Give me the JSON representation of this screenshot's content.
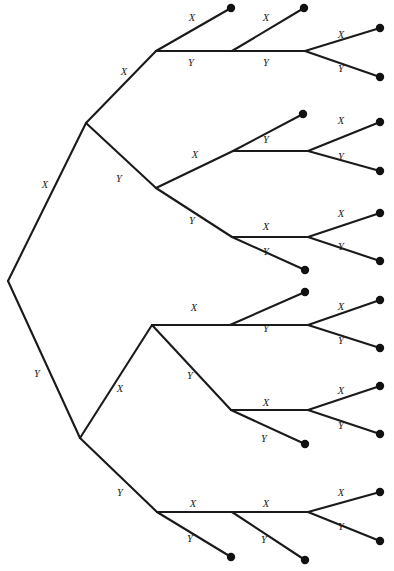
{
  "diagram": {
    "type": "binary-decision-tree",
    "background_color": "#ffffff",
    "line_color": "#1a1a1a",
    "node_color": "#111111",
    "label_x": "X",
    "label_y": "Y",
    "depth": 4,
    "terminal_count": 16,
    "root": {
      "x": 8,
      "y": 281
    },
    "nodes": [
      {
        "id": "root",
        "x": 8,
        "y": 281
      },
      {
        "id": "n-x",
        "x": 86,
        "y": 123
      },
      {
        "id": "n-y",
        "x": 80,
        "y": 438
      },
      {
        "id": "n-xx",
        "x": 156,
        "y": 51
      },
      {
        "id": "n-xy",
        "x": 156,
        "y": 188
      },
      {
        "id": "n-yx",
        "x": 152,
        "y": 325
      },
      {
        "id": "n-yy",
        "x": 157,
        "y": 512
      },
      {
        "id": "n-xxx",
        "x": 232,
        "y": 51
      },
      {
        "id": "n-xxy",
        "x": 233,
        "y": 151
      },
      {
        "id": "n-xyx",
        "x": 232,
        "y": 237
      },
      {
        "id": "n-xyy",
        "x": 230,
        "y": 325
      },
      {
        "id": "n-yxx",
        "x": 231,
        "y": 410
      },
      {
        "id": "n-yxy",
        "x": 232,
        "y": 512
      },
      {
        "id": "n-yyx",
        "x": 305,
        "y": 51
      }
    ],
    "edges": [
      {
        "from": "root",
        "to": "n-x",
        "label": "X",
        "lx": 43,
        "ly": 188
      },
      {
        "from": "root",
        "to": "n-y",
        "label": "Y",
        "lx": 37,
        "ly": 373
      },
      {
        "from": "n-x",
        "to": "n-xx",
        "label": "X",
        "lx": 123,
        "ly": 73
      },
      {
        "from": "n-x",
        "to": "n-xy",
        "label": "Y",
        "lx": 118,
        "ly": 178
      },
      {
        "from": "n-y",
        "to": "n-yx",
        "label": "X",
        "lx": 117,
        "ly": 390
      },
      {
        "from": "n-y",
        "to": "n-yy",
        "label": "Y",
        "lx": 117,
        "ly": 493
      },
      {
        "from": "n-xx",
        "to": "t1",
        "label": "X",
        "lx": 192,
        "ly": 20
      },
      {
        "from": "n-xx",
        "to": "n-xxx",
        "label": "Y",
        "lx": 192,
        "ly": 64
      },
      {
        "from": "n-xy",
        "to": "n-xxy",
        "label": "X",
        "lx": 194,
        "ly": 156
      },
      {
        "from": "n-xy",
        "to": "n-xyx",
        "label": "Y",
        "lx": 192,
        "ly": 222
      },
      {
        "from": "n-yx",
        "to": "n-xyy",
        "label": "X",
        "lx": 192,
        "ly": 309
      },
      {
        "from": "n-yx",
        "to": "n-yxx",
        "label": "Y",
        "lx": 188,
        "ly": 377
      },
      {
        "from": "n-yy",
        "to": "n-yxy",
        "label": "X",
        "lx": 193,
        "ly": 505
      },
      {
        "from": "n-yy",
        "to": "t16",
        "label": "Y",
        "lx": 192,
        "ly": 541
      },
      {
        "from": "n-xxx",
        "to": "t2",
        "label": "X",
        "lx": 265,
        "ly": 20
      },
      {
        "from": "n-xxx",
        "to": "n-yyx",
        "label": "Y",
        "lx": 266,
        "ly": 64
      },
      {
        "from": "n-xxy",
        "to": "t3",
        "label": "X",
        "lx": 268,
        "ly": 124
      },
      {
        "from": "n-xxy",
        "to": "t4",
        "label": "Y",
        "lx": 268,
        "ly": 163
      },
      {
        "from": "n-xyx",
        "to": "t5",
        "label": "X",
        "lx": 266,
        "ly": 302
      },
      {
        "from": "n-xyx",
        "to": "t6",
        "label": "Y",
        "lx": 266,
        "ly": 253
      },
      {
        "from": "n-xyy",
        "to": "t7",
        "label": "X",
        "lx": 266,
        "ly": 340
      },
      {
        "from": "n-yxx",
        "to": "t8",
        "label": "X",
        "lx": 266,
        "ly": 393
      },
      {
        "from": "n-yxx",
        "to": "t9",
        "label": "Y",
        "lx": 266,
        "ly": 432
      },
      {
        "from": "n-yxy",
        "to": "t10",
        "label": "X",
        "lx": 266,
        "ly": 505
      },
      {
        "from": "n-yxy",
        "to": "t11",
        "label": "Y",
        "lx": 266,
        "ly": 541
      },
      {
        "from": "n-yyx",
        "to": "t12",
        "label": "X",
        "lx": 340,
        "ly": 36
      },
      {
        "from": "n-yyx",
        "to": "t13",
        "label": "Y",
        "lx": 340,
        "ly": 66
      },
      {
        "from": "n-yyx2",
        "to": "t14",
        "label": "X",
        "lx": 340,
        "ly": 133
      },
      {
        "from": "n-yyx2",
        "to": "t15",
        "label": "Y",
        "lx": 340,
        "ly": 165
      }
    ],
    "terminals": [
      {
        "id": "t1",
        "x": 231,
        "y": 8
      },
      {
        "id": "t2",
        "x": 304,
        "y": 8
      },
      {
        "id": "t3",
        "x": 380,
        "y": 28
      },
      {
        "id": "t4",
        "x": 380,
        "y": 77
      },
      {
        "id": "t5",
        "x": 303,
        "y": 114
      },
      {
        "id": "t6",
        "x": 380,
        "y": 122
      },
      {
        "id": "t7",
        "x": 380,
        "y": 171
      },
      {
        "id": "t8",
        "x": 305,
        "y": 228
      },
      {
        "id": "t9",
        "x": 380,
        "y": 213
      },
      {
        "id": "t10",
        "x": 380,
        "y": 261
      },
      {
        "id": "t11",
        "x": 305,
        "y": 270
      },
      {
        "id": "t12",
        "x": 305,
        "y": 292
      },
      {
        "id": "t13",
        "x": 380,
        "y": 300
      },
      {
        "id": "t14",
        "x": 380,
        "y": 348
      },
      {
        "id": "t15",
        "x": 305,
        "y": 385
      },
      {
        "id": "t16",
        "x": 380,
        "y": 386
      },
      {
        "id": "t17",
        "x": 380,
        "y": 434
      },
      {
        "id": "t18",
        "x": 303,
        "y": 444
      },
      {
        "id": "t19",
        "x": 231,
        "y": 557
      },
      {
        "id": "t20",
        "x": 305,
        "y": 560
      },
      {
        "id": "t21",
        "x": 380,
        "y": 492
      },
      {
        "id": "t22",
        "x": 380,
        "y": 541
      }
    ]
  },
  "edge_labels": {
    "l1": {
      "text": "X",
      "x": 45,
      "y": 186
    },
    "l2": {
      "text": "Y",
      "x": 37,
      "y": 375
    },
    "l3": {
      "text": "X",
      "x": 124,
      "y": 73
    },
    "l4": {
      "text": "Y",
      "x": 119,
      "y": 180
    },
    "l5": {
      "text": "X",
      "x": 120,
      "y": 390
    },
    "l6": {
      "text": "Y",
      "x": 120,
      "y": 494
    },
    "l7": {
      "text": "X",
      "x": 192,
      "y": 19
    },
    "l8": {
      "text": "Y",
      "x": 191,
      "y": 64
    },
    "l9": {
      "text": "X",
      "x": 266,
      "y": 19
    },
    "l10": {
      "text": "Y",
      "x": 266,
      "y": 64
    },
    "l11": {
      "text": "X",
      "x": 341,
      "y": 36
    },
    "l12": {
      "text": "Y",
      "x": 341,
      "y": 70
    },
    "l13": {
      "text": "X",
      "x": 195,
      "y": 156
    },
    "l14": {
      "text": "Y",
      "x": 266,
      "y": 141
    },
    "l15": {
      "text": "X",
      "x": 341,
      "y": 122
    },
    "l16": {
      "text": "Y",
      "x": 341,
      "y": 158
    },
    "l17": {
      "text": "Y",
      "x": 192,
      "y": 222
    },
    "l18": {
      "text": "X",
      "x": 266,
      "y": 228
    },
    "l19": {
      "text": "Y",
      "x": 266,
      "y": 253
    },
    "l20": {
      "text": "X",
      "x": 341,
      "y": 215
    },
    "l21": {
      "text": "Y",
      "x": 341,
      "y": 248
    },
    "l22": {
      "text": "X",
      "x": 194,
      "y": 309
    },
    "l23": {
      "text": "Y",
      "x": 266,
      "y": 330
    },
    "l24": {
      "text": "X",
      "x": 341,
      "y": 308
    },
    "l25": {
      "text": "Y",
      "x": 341,
      "y": 342
    },
    "l26": {
      "text": "Y",
      "x": 190,
      "y": 377
    },
    "l27": {
      "text": "X",
      "x": 266,
      "y": 404
    },
    "l28": {
      "text": "Y",
      "x": 264,
      "y": 440
    },
    "l29": {
      "text": "X",
      "x": 341,
      "y": 392
    },
    "l30": {
      "text": "Y",
      "x": 341,
      "y": 427
    },
    "l31": {
      "text": "X",
      "x": 193,
      "y": 505
    },
    "l32": {
      "text": "Y",
      "x": 190,
      "y": 540
    },
    "l33": {
      "text": "X",
      "x": 266,
      "y": 505
    },
    "l34": {
      "text": "Y",
      "x": 264,
      "y": 541
    },
    "l35": {
      "text": "X",
      "x": 341,
      "y": 494
    },
    "l36": {
      "text": "Y",
      "x": 341,
      "y": 528
    }
  }
}
